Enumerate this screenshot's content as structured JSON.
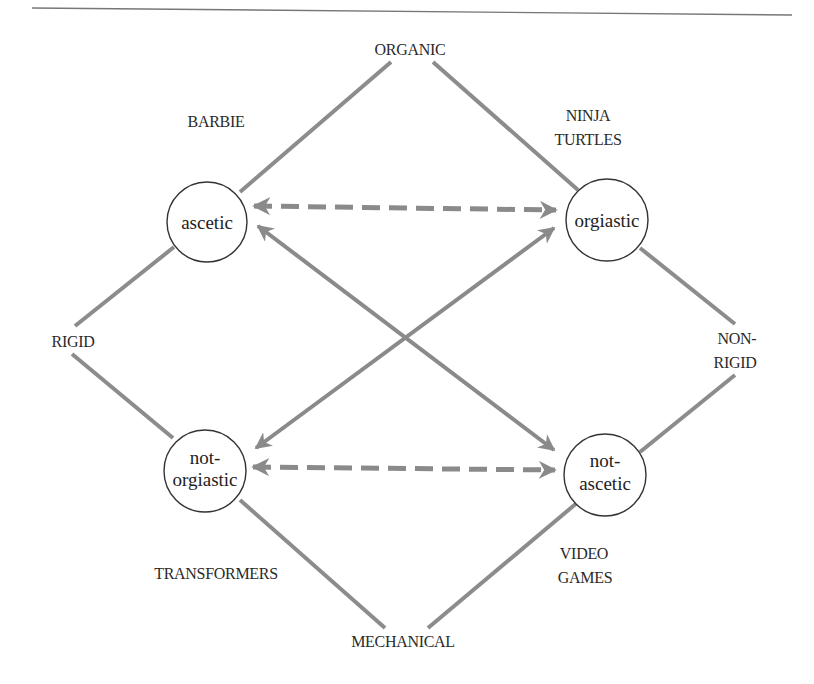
{
  "diagram": {
    "type": "semiotic-square",
    "colors": {
      "edge": "#8c8c8c",
      "arrow": "#8a8a8a",
      "circle_stroke": "#333333",
      "text": "#222222",
      "rule": "#777777"
    },
    "poles": {
      "top": "ORGANIC",
      "bottom": "MECHANICAL",
      "left": "RIGID",
      "right_line1": "NON-",
      "right_line2": "RIGID"
    },
    "examples": {
      "top_left": "BARBIE",
      "top_right_line1": "NINJA",
      "top_right_line2": "TURTLES",
      "bottom_left": "TRANSFORMERS",
      "bottom_right_line1": "VIDEO",
      "bottom_right_line2": "GAMES"
    },
    "nodes": {
      "top_left": {
        "line1": "ascetic"
      },
      "top_right": {
        "line1": "orgiastic"
      },
      "bottom_left": {
        "line1": "not-",
        "line2": "orgiastic"
      },
      "bottom_right": {
        "line1": "not-",
        "line2": "ascetic"
      }
    },
    "relations": [
      {
        "from": "ascetic",
        "to": "orgiastic",
        "style": "dashed",
        "direction": "bidirectional"
      },
      {
        "from": "not-orgiastic",
        "to": "not-ascetic",
        "style": "dashed",
        "direction": "bidirectional"
      },
      {
        "from": "ascetic",
        "to": "not-ascetic",
        "style": "solid",
        "direction": "bidirectional"
      },
      {
        "from": "orgiastic",
        "to": "not-orgiastic",
        "style": "solid",
        "direction": "bidirectional"
      }
    ]
  }
}
